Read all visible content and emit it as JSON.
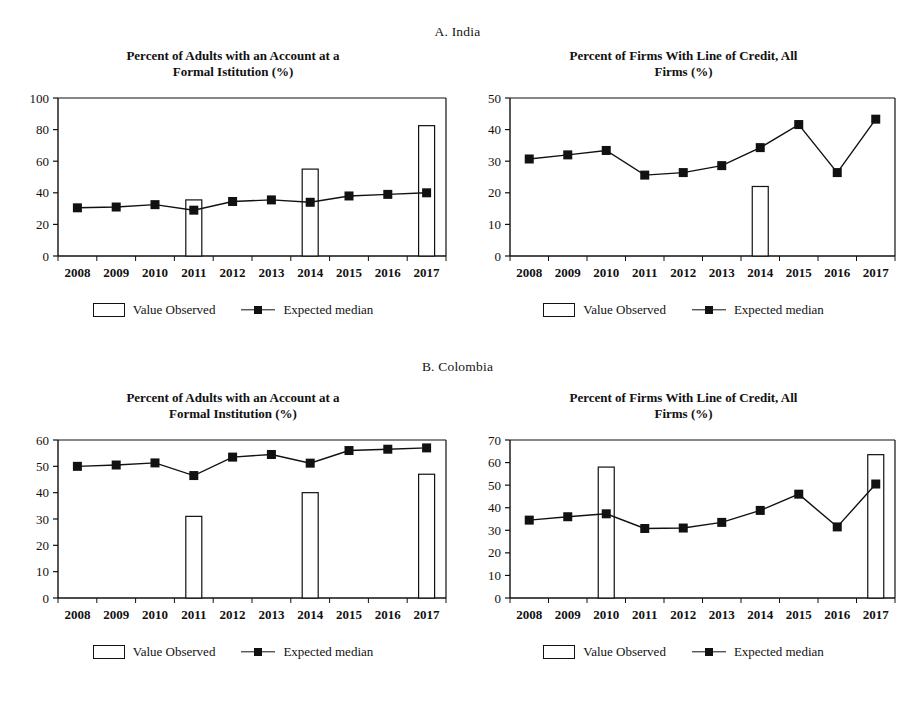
{
  "panels": [
    {
      "id": "A",
      "heading": "A. India"
    },
    {
      "id": "B",
      "heading": "B. Colombia"
    }
  ],
  "legend": {
    "bar_label": "Value Observed",
    "line_label": "Expected median",
    "bar_icon": "hollow-rectangle-icon",
    "line_icon": "line-with-square-marker-icon"
  },
  "colors": {
    "ink": "#111111",
    "bar_fill": "#ffffff",
    "marker": "#111111",
    "background": "#ffffff"
  },
  "chart_data": [
    {
      "type": "bar",
      "id": "india-accounts",
      "panel": "A. India",
      "title": "Percent of Adults with an Account at a Formal Istitution (%)",
      "title_lines": [
        "Percent of Adults with an Account at a",
        "Formal Istitution (%)"
      ],
      "xlabel": "",
      "ylabel": "",
      "ylim": [
        0,
        100
      ],
      "yticks": [
        0,
        20,
        40,
        60,
        80,
        100
      ],
      "grid": false,
      "legend_position": "below",
      "categories": [
        "2008",
        "2009",
        "2010",
        "2011",
        "2012",
        "2013",
        "2014",
        "2015",
        "2016",
        "2017"
      ],
      "series": [
        {
          "name": "Value Observed",
          "type": "bar",
          "values": [
            null,
            null,
            null,
            35.5,
            null,
            null,
            55,
            null,
            null,
            82.5
          ]
        },
        {
          "name": "Expected median",
          "type": "line",
          "values": [
            30.5,
            31,
            32.5,
            29,
            34.5,
            35.5,
            34,
            38,
            39,
            40
          ]
        }
      ]
    },
    {
      "type": "bar",
      "id": "india-credit",
      "panel": "A. India",
      "title": "Percent of Firms With Line of Credit, All Firms (%)",
      "title_lines": [
        "Percent of Firms With Line of Credit, All",
        "Firms (%)"
      ],
      "xlabel": "",
      "ylabel": "",
      "ylim": [
        0,
        50
      ],
      "yticks": [
        0,
        10,
        20,
        30,
        40,
        50
      ],
      "grid": false,
      "legend_position": "below",
      "categories": [
        "2008",
        "2009",
        "2010",
        "2011",
        "2012",
        "2013",
        "2014",
        "2015",
        "2016",
        "2017"
      ],
      "series": [
        {
          "name": "Value Observed",
          "type": "bar",
          "values": [
            null,
            null,
            null,
            null,
            null,
            null,
            22,
            null,
            null,
            null
          ]
        },
        {
          "name": "Expected median",
          "type": "line",
          "values": [
            30.7,
            32,
            33.4,
            25.6,
            26.4,
            28.6,
            34.3,
            41.6,
            26.4,
            43.3
          ]
        }
      ]
    },
    {
      "type": "bar",
      "id": "colombia-accounts",
      "panel": "B. Colombia",
      "title": "Percent of Adults with an Account at a Formal Institution (%)",
      "title_lines": [
        "Percent of Adults with an Account at a",
        "Formal Institution (%)"
      ],
      "xlabel": "",
      "ylabel": "",
      "ylim": [
        0,
        60
      ],
      "yticks": [
        0,
        10,
        20,
        30,
        40,
        50,
        60
      ],
      "grid": false,
      "legend_position": "below",
      "categories": [
        "2008",
        "2009",
        "2010",
        "2011",
        "2012",
        "2013",
        "2014",
        "2015",
        "2016",
        "2017"
      ],
      "series": [
        {
          "name": "Value Observed",
          "type": "bar",
          "values": [
            null,
            null,
            null,
            31,
            null,
            null,
            40,
            null,
            null,
            47
          ]
        },
        {
          "name": "Expected median",
          "type": "line",
          "values": [
            50,
            50.5,
            51.3,
            46.5,
            53.5,
            54.5,
            51.2,
            56,
            56.5,
            57
          ]
        }
      ]
    },
    {
      "type": "bar",
      "id": "colombia-credit",
      "panel": "B. Colombia",
      "title": "Percent of Firms With Line of Credit, All Firms (%)",
      "title_lines": [
        "Percent of Firms With Line of Credit, All",
        "Firms (%)"
      ],
      "xlabel": "",
      "ylabel": "",
      "ylim": [
        0,
        70
      ],
      "yticks": [
        0,
        10,
        20,
        30,
        40,
        50,
        60,
        70
      ],
      "grid": false,
      "legend_position": "below",
      "categories": [
        "2008",
        "2009",
        "2010",
        "2011",
        "2012",
        "2013",
        "2014",
        "2015",
        "2016",
        "2017"
      ],
      "series": [
        {
          "name": "Value Observed",
          "type": "bar",
          "values": [
            null,
            null,
            58,
            null,
            null,
            null,
            null,
            null,
            null,
            63.5
          ]
        },
        {
          "name": "Expected median",
          "type": "line",
          "values": [
            34.5,
            36,
            37.3,
            30.8,
            31,
            33.5,
            38.8,
            46,
            31.5,
            50.5
          ]
        }
      ]
    }
  ]
}
